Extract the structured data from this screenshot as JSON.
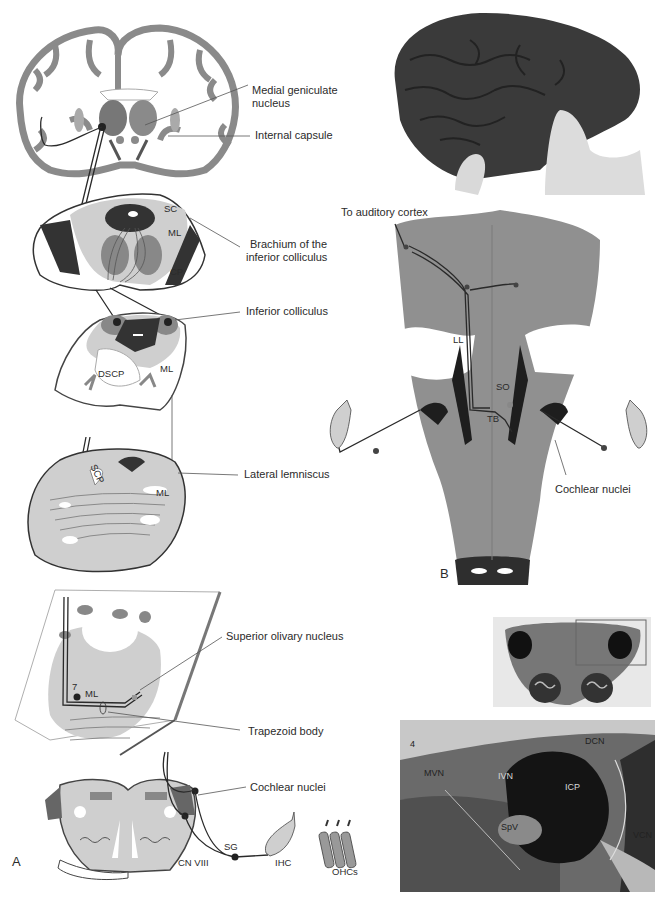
{
  "figure": {
    "panels": {
      "a": {
        "letter": "A"
      },
      "b": {
        "letter": "B"
      }
    },
    "panel_a": {
      "callouts": [
        {
          "id": "medial-geniculate",
          "text_lines": [
            "Medial geniculate",
            "nucleus"
          ]
        },
        {
          "id": "internal-capsule",
          "text_lines": [
            "Internal capsule"
          ]
        },
        {
          "id": "brachium-ic",
          "text_lines": [
            "Brachium of the",
            "inferior colliculus"
          ]
        },
        {
          "id": "inferior-colliculus",
          "text_lines": [
            "Inferior colliculus"
          ]
        },
        {
          "id": "lateral-lemniscus",
          "text_lines": [
            "Lateral lemniscus"
          ]
        },
        {
          "id": "superior-olivary",
          "text_lines": [
            "Superior olivary nucleus"
          ]
        },
        {
          "id": "trapezoid-body",
          "text_lines": [
            "Trapezoid body"
          ]
        },
        {
          "id": "cochlear-nuclei",
          "text_lines": [
            "Cochlear nuclei"
          ]
        }
      ],
      "inner_labels": {
        "sc": "SC",
        "ml_midbrain": "ML",
        "cp": "CP",
        "dscp": "DSCP",
        "ml_ic": "ML",
        "scp": "SCP",
        "ml_pons": "ML",
        "seven": "7",
        "ml_so": "ML",
        "sg": "SG",
        "cn8": "CN VIII",
        "ihc": "IHC",
        "ohcs": "OHCs"
      }
    },
    "panel_b": {
      "top_label": "To auditory cortex",
      "inner_labels": {
        "ll": "LL",
        "so": "SO",
        "tb": "TB"
      },
      "callout": "Cochlear nuclei"
    },
    "histology": {
      "labels": {
        "four": "4",
        "dcn": "DCN",
        "mvn": "MVN",
        "ivn": "IVN",
        "icp": "ICP",
        "spv": "SpV",
        "vcn": "VCN"
      }
    }
  }
}
